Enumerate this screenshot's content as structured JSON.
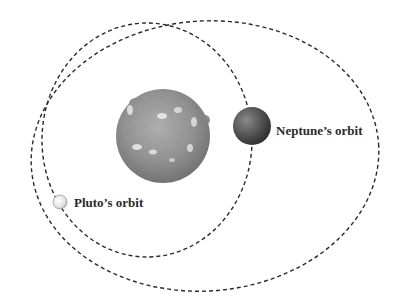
{
  "diagram": {
    "title": "",
    "labels": {
      "neptune": "Neptune’s orbit",
      "pluto": "Pluto’s orbit"
    },
    "colors": {
      "background": "#ffffff",
      "orbit_line": "#2a2a2a",
      "sun": "#9a9a9a",
      "neptune": "#555555",
      "pluto": "#e6e6e6",
      "label_text": "#2a2a2a"
    },
    "bodies": [
      {
        "name": "Sun",
        "cx": 163,
        "cy": 136,
        "r": 47
      },
      {
        "name": "Neptune",
        "cx": 252,
        "cy": 126,
        "r": 19
      },
      {
        "name": "Pluto",
        "cx": 60,
        "cy": 202,
        "r": 7
      }
    ],
    "orbits": [
      {
        "name": "Neptune's orbit",
        "cx": 147,
        "cy": 140,
        "rx": 105,
        "ry": 117,
        "style": "dashed"
      },
      {
        "name": "Pluto's orbit",
        "cx": 205,
        "cy": 156,
        "rx": 174,
        "ry": 135,
        "style": "dashed"
      }
    ]
  }
}
